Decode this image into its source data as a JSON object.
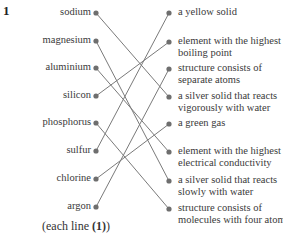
{
  "question_number": "1",
  "left_items": [
    "sodium",
    "magnesium",
    "aluminium",
    "silicon",
    "phosphorus",
    "sulfur",
    "chlorine",
    "argon"
  ],
  "right_items": [
    [
      "a yellow solid"
    ],
    [
      "element with the highest",
      "boiling point"
    ],
    [
      "structure consists of",
      "separate atoms"
    ],
    [
      "a silver solid that reacts",
      "vigorously with water"
    ],
    [
      "a green gas"
    ],
    [
      "element with the highest",
      "electrical conductivity"
    ],
    [
      "a silver solid that reacts",
      "slowly with water"
    ],
    [
      "structure consists of",
      "molecules with four atoms"
    ]
  ],
  "matches": [
    {
      "left": "sodium",
      "right": "a silver solid that reacts vigorously with water"
    },
    {
      "left": "magnesium",
      "right": "a silver solid that reacts slowly with water"
    },
    {
      "left": "aluminium",
      "right": "element with the highest electrical conductivity"
    },
    {
      "left": "silicon",
      "right": "element with the highest boiling point"
    },
    {
      "left": "phosphorus",
      "right": "structure consists of molecules with four atoms"
    },
    {
      "left": "sulfur",
      "right": "a yellow solid"
    },
    {
      "left": "chlorine",
      "right": "a green gas"
    },
    {
      "left": "argon",
      "right": "structure consists of separate atoms"
    }
  ],
  "match_index": [
    3,
    6,
    5,
    1,
    7,
    0,
    4,
    2
  ],
  "footer": {
    "prefix": "(each line ",
    "mark": "(1)",
    "suffix": ")"
  },
  "colors": {
    "line": "#7a7a7a",
    "dot": "#6e6e6e",
    "text": "#3a3a3a"
  }
}
